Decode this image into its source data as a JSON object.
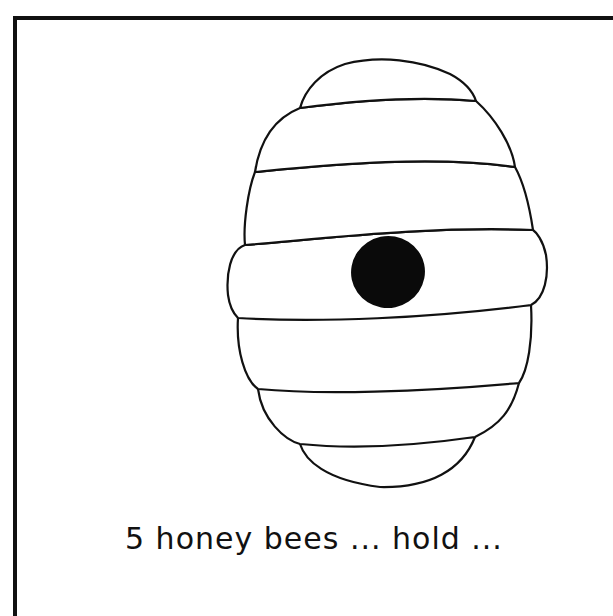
{
  "illustration": {
    "subject": "beehive",
    "style": "black-and-white line drawing",
    "band_count": 5,
    "has_top_cap": true,
    "has_bottom_cap": true,
    "entrance": "black oval hole in center band",
    "colors": {
      "outline": "#111111",
      "fill": "#ffffff",
      "entrance": "#0a0a0a",
      "frame": "#111111"
    }
  },
  "caption": {
    "text": "5 honey bees ... hold ...",
    "clipped": true
  }
}
